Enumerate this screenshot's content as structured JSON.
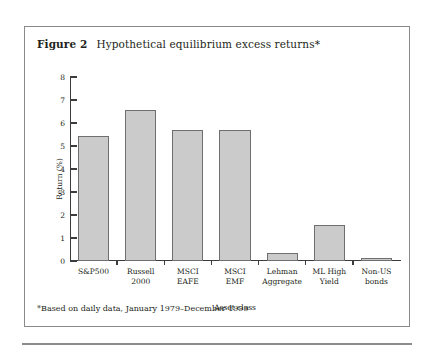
{
  "figure": {
    "label": "Figure 2",
    "title": "Hypothetical equilibrium excess returns*",
    "footnote": "*Based on daily data, January 1979–December 1999"
  },
  "chart_data": {
    "type": "bar",
    "title": "Hypothetical equilibrium excess returns*",
    "xlabel": "Asset class",
    "ylabel": "Return (%)",
    "ylim": [
      0,
      8
    ],
    "yticks": [
      0,
      1,
      2,
      3,
      4,
      5,
      6,
      7,
      8
    ],
    "ytick_labels": [
      "0",
      "1",
      "2",
      "3",
      "4",
      "5",
      "6",
      "7",
      "8"
    ],
    "grid": false,
    "legend": null,
    "bar_color": "#cbcbcb",
    "bar_edge_color": "#6f6f6f",
    "categories": [
      "S&P500",
      "Russell 2000",
      "MSCI EAFE",
      "MSCI EMF",
      "Lehman Aggregate",
      "ML High Yield",
      "Non-US bonds"
    ],
    "category_lines": [
      [
        "S&P500"
      ],
      [
        "Russell",
        "2000"
      ],
      [
        "MSCI",
        "EAFE"
      ],
      [
        "MSCI",
        "EMF"
      ],
      [
        "Lehman",
        "Aggregate"
      ],
      [
        "ML High",
        "Yield"
      ],
      [
        "Non-US",
        "bonds"
      ]
    ],
    "values": [
      5.45,
      6.55,
      5.7,
      5.7,
      0.35,
      1.55,
      0.15
    ]
  }
}
